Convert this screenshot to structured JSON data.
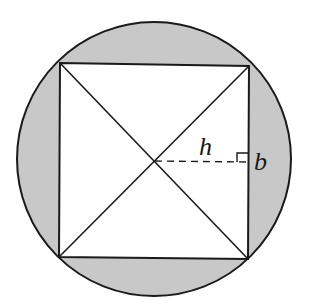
{
  "figure": {
    "type": "square inscribed in circle",
    "colors": {
      "background": "#ffffff",
      "shaded_region": "#c8c8c8",
      "stroke": "#1a1a1a"
    },
    "circle": {
      "cx": 154,
      "cy": 159,
      "r": 137
    },
    "square": {
      "corners": {
        "top_left": [
          60,
          63
        ],
        "top_right": [
          249,
          66
        ],
        "bottom_right": [
          248,
          259
        ],
        "bottom_left": [
          59,
          257
        ]
      }
    },
    "center_point": [
      154,
      161
    ],
    "labels": {
      "height": "h",
      "base": "b"
    }
  }
}
